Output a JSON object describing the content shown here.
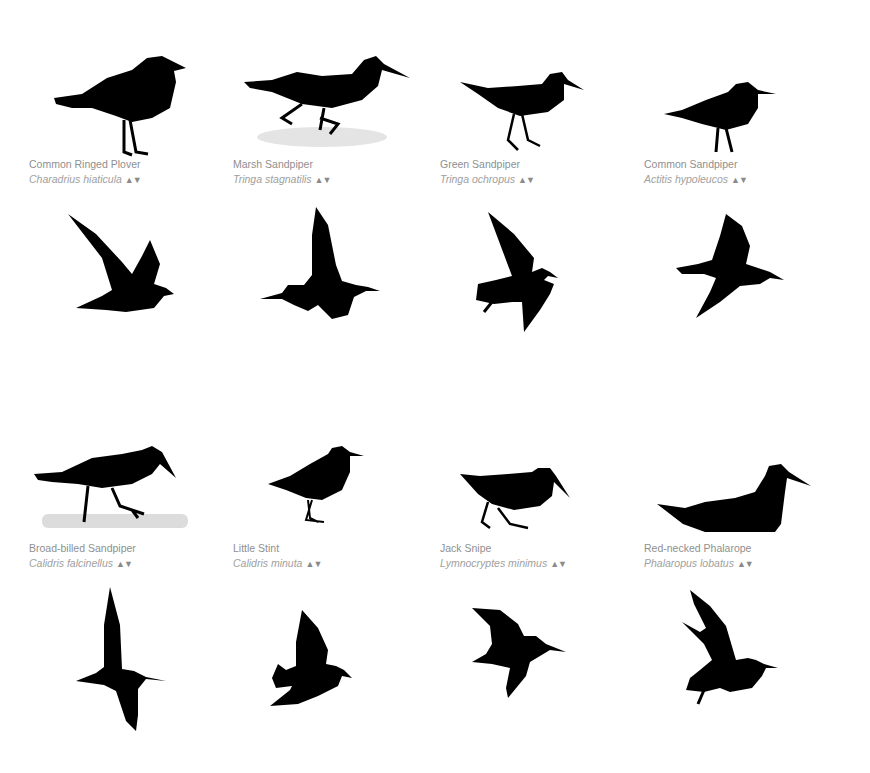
{
  "species": [
    {
      "common": "Common Ringed Plover",
      "scientific": "Charadrius hiaticula",
      "sort_up": "▲",
      "sort_down": "▼"
    },
    {
      "common": "Marsh Sandpiper",
      "scientific": "Tringa stagnatilis",
      "sort_up": "▲",
      "sort_down": "▼"
    },
    {
      "common": "Green Sandpiper",
      "scientific": "Tringa ochropus",
      "sort_up": "▲",
      "sort_down": "▼"
    },
    {
      "common": "Common Sandpiper",
      "scientific": "Actitis hypoleucos",
      "sort_up": "▲",
      "sort_down": "▼"
    },
    {
      "common": "Broad-billed Sandpiper",
      "scientific": "Calidris falcinellus",
      "sort_up": "▲",
      "sort_down": "▼"
    },
    {
      "common": "Little Stint",
      "scientific": "Calidris minuta",
      "sort_up": "▲",
      "sort_down": "▼"
    },
    {
      "common": "Jack Snipe",
      "scientific": "Lymnocryptes minimus",
      "sort_up": "▲",
      "sort_down": "▼"
    },
    {
      "common": "Red-necked Phalarope",
      "scientific": "Phalaropus lobatus",
      "sort_up": "▲",
      "sort_down": "▼"
    }
  ],
  "colors": {
    "silhouette": "#000000",
    "caption": "#8f8f8f",
    "background": "#ffffff"
  }
}
